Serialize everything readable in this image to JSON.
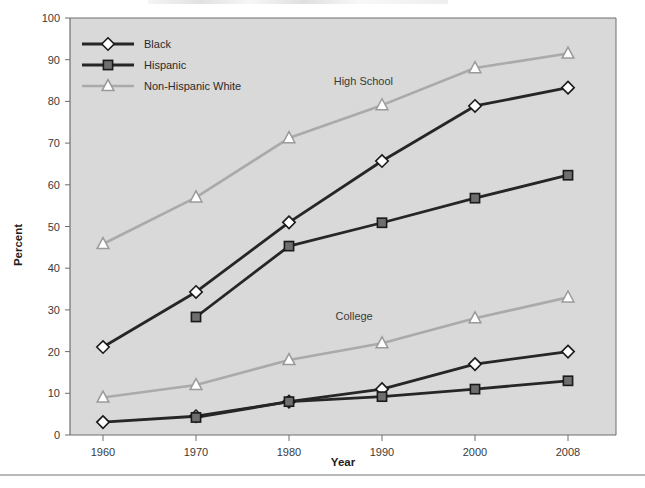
{
  "figure": {
    "cropped_title_sliver": "",
    "plot_background": "#d9d9d9",
    "page_background": "#ffffff",
    "border_color": "#6e6e6e"
  },
  "chart_data": {
    "type": "line",
    "title": "",
    "xlabel": "Year",
    "ylabel": "Percent",
    "categories": [
      "1960",
      "1970",
      "1980",
      "1990",
      "2000",
      "2008"
    ],
    "x": [
      1960,
      1970,
      1980,
      1990,
      2000,
      2008
    ],
    "ylim": [
      0,
      100
    ],
    "yticks": [
      0,
      10,
      20,
      30,
      40,
      50,
      60,
      70,
      80,
      90,
      100
    ],
    "grid": false,
    "legend_position": "top-left",
    "annotations": [
      {
        "text": "High School",
        "x": 1988,
        "y": 84
      },
      {
        "text": "College",
        "x": 1987,
        "y": 27.5
      }
    ],
    "groups": [
      {
        "name": "High School",
        "series": [
          {
            "name": "Black",
            "marker": "diamond",
            "color": "#262626",
            "values": [
              21.1,
              34.3,
              51.0,
              65.7,
              78.9,
              83.3
            ]
          },
          {
            "name": "Hispanic",
            "marker": "square",
            "color": "#262626",
            "values": [
              null,
              28.3,
              45.3,
              50.9,
              56.8,
              62.3
            ]
          },
          {
            "name": "Non-Hispanic White",
            "marker": "triangle",
            "color": "#aaaaaa",
            "values": [
              45.8,
              57.0,
              71.2,
              79.1,
              88.0,
              91.5
            ]
          }
        ]
      },
      {
        "name": "College",
        "series": [
          {
            "name": "Black",
            "marker": "diamond",
            "color": "#262626",
            "values": [
              3.1,
              4.5,
              8.0,
              11.0,
              17.0,
              20.0
            ]
          },
          {
            "name": "Hispanic",
            "marker": "square",
            "color": "#262626",
            "values": [
              null,
              4.2,
              8.0,
              9.2,
              11.0,
              13.0
            ]
          },
          {
            "name": "Non-Hispanic White",
            "marker": "triangle",
            "color": "#aaaaaa",
            "values": [
              9.0,
              12.0,
              18.0,
              22.0,
              28.0,
              33.0
            ]
          }
        ]
      }
    ]
  },
  "legend": {
    "items": [
      {
        "label": "Black",
        "marker": "diamond",
        "color": "#262626"
      },
      {
        "label": "Hispanic",
        "marker": "square",
        "color": "#262626"
      },
      {
        "label": "Non-Hispanic White",
        "marker": "triangle",
        "color": "#aaaaaa"
      }
    ]
  }
}
